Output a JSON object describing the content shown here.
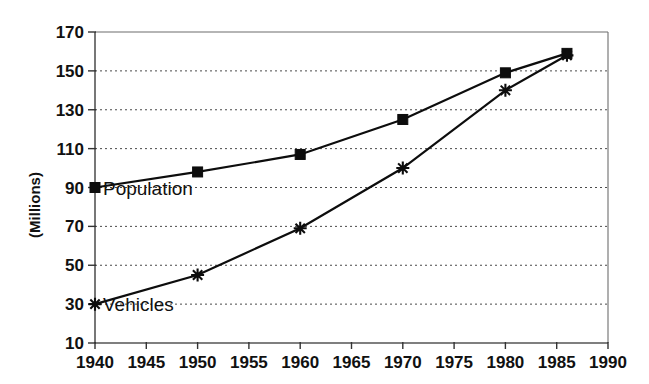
{
  "chart_data": {
    "type": "line",
    "title": "",
    "xlabel": "",
    "ylabel": "(Millions)",
    "xlim": [
      1940,
      1990
    ],
    "ylim": [
      10,
      170
    ],
    "xticks": [
      1940,
      1945,
      1950,
      1955,
      1960,
      1965,
      1970,
      1975,
      1980,
      1985,
      1990
    ],
    "yticks": [
      10,
      30,
      50,
      70,
      90,
      110,
      130,
      150,
      170
    ],
    "grid": true,
    "legend_position": "inline-annotation",
    "series": [
      {
        "name": "Population",
        "marker": "square",
        "x": [
          1940,
          1950,
          1960,
          1970,
          1980,
          1986
        ],
        "values": [
          90,
          98,
          107,
          125,
          149,
          159
        ]
      },
      {
        "name": "Vehicles",
        "marker": "star",
        "x": [
          1940,
          1950,
          1960,
          1970,
          1980,
          1986
        ],
        "values": [
          30,
          45,
          69,
          100,
          140,
          158
        ]
      }
    ],
    "annotations": [
      {
        "text": "Population",
        "x": 1940,
        "y": 90
      },
      {
        "text": "Vehicles",
        "x": 1940,
        "y": 30
      }
    ]
  },
  "axes": {
    "y_tick_labels": [
      "170",
      "150",
      "130",
      "110",
      "90",
      "70",
      "50",
      "30",
      "10"
    ],
    "x_tick_labels": [
      "1940",
      "1945",
      "1950",
      "1955",
      "1960",
      "1965",
      "1970",
      "1975",
      "1980",
      "1985",
      "1990"
    ],
    "y_axis_title": "(Millions)"
  },
  "annotations": {
    "population_label": "Population",
    "vehicles_label": "Vehicles"
  },
  "colors": {
    "ink": "#0d0d0d",
    "grid": "#4a4a4a",
    "frame": "#6d6d6d",
    "background": "#ffffff"
  }
}
